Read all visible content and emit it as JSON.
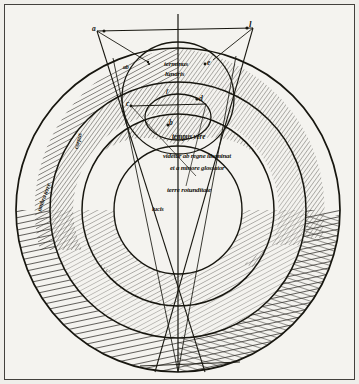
{
  "document": {
    "title": "Medieval cosmological diagram",
    "description": "Hand-drawn manuscript diagram of concentric celestial spheres with the Earth's shadow cone, annotated in abbreviated Latin cursive",
    "medium": "ink on parchment, photographic reproduction"
  },
  "page": {
    "background_color": "#f4f3ef",
    "border_color": "#43413d",
    "ink_color": "#15140e"
  },
  "diagram": {
    "type": "concentric-circles-with-shadow-cone",
    "center": {
      "x": 178,
      "y": 210
    },
    "circles": [
      {
        "name": "outermost-sphere",
        "radius": 162,
        "shading": "dense-radial-hatching"
      },
      {
        "name": "second-sphere",
        "radius": 128,
        "shading": "fine-hatching-upper-arc"
      },
      {
        "name": "third-sphere",
        "radius": 96,
        "shading": "hatched-band"
      },
      {
        "name": "fourth-sphere",
        "radius": 64,
        "shading": "none"
      },
      {
        "name": "inner-small-circle",
        "radius": 33,
        "shading": "none"
      },
      {
        "name": "top-small-circle",
        "radius": 56,
        "shading": "none"
      }
    ],
    "axis": {
      "name": "vertical-axis",
      "from_y": 14,
      "to_y": 368
    }
  },
  "labels": {
    "point_a": "a",
    "point_l": "l",
    "point_c": "c",
    "point_d": "d",
    "point_e": "e",
    "point_b": "b",
    "point_f": "f",
    "point_ab": "ab"
  },
  "annotations": {
    "upper_center_line1": "terminus",
    "upper_center_line2": "lunaris",
    "center_line1": "tempus vere",
    "center_line2": "videtur ab regne illuminat",
    "center_line3": "et a minore glossator",
    "center_line4": "terre rotunditate",
    "inner_bottom": "lucis",
    "left_outer_rotated": "umbra terre",
    "left_inner_rotated": "corpus"
  },
  "colors": {
    "paper": "#f4f3ef",
    "ink": "#15140e",
    "frame": "#43413d",
    "hatch": "#2a2823"
  }
}
